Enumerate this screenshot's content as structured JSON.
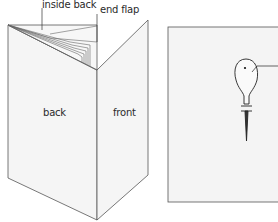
{
  "figure": {
    "left_diagram": {
      "labels": {
        "inside_back": "inside back",
        "end_flap": "end flap",
        "back": "back",
        "front": "front"
      }
    },
    "right_diagram": {
      "description": "page with awl piercing"
    },
    "colors": {
      "line": "#555555",
      "panel_fill": "#f4f4f4",
      "background": "#ffffff"
    }
  }
}
